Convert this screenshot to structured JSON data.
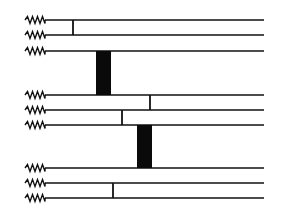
{
  "diagram": {
    "colors": {
      "line": "#111111",
      "block": "#0a0a0a",
      "background": "#ffffff"
    },
    "line_x_start": 45,
    "line_x_end": 264,
    "zigzag_x_start": 25,
    "strands": [
      {
        "id": 1,
        "y": 20
      },
      {
        "id": 2,
        "y": 35
      },
      {
        "id": 3,
        "y": 51
      },
      {
        "id": 4,
        "y": 95
      },
      {
        "id": 5,
        "y": 110
      },
      {
        "id": 6,
        "y": 125
      },
      {
        "id": 7,
        "y": 168
      },
      {
        "id": 8,
        "y": 183
      },
      {
        "id": 9,
        "y": 198
      }
    ],
    "connectors": [
      {
        "x": 73,
        "y1": 20,
        "y2": 35
      },
      {
        "x": 150,
        "y1": 95,
        "y2": 110
      },
      {
        "x": 122,
        "y1": 110,
        "y2": 125
      },
      {
        "x": 113,
        "y1": 183,
        "y2": 198
      }
    ],
    "blocks": [
      {
        "x": 96,
        "y1": 51,
        "y2": 95,
        "width": 15
      },
      {
        "x": 137,
        "y1": 125,
        "y2": 168,
        "width": 15
      }
    ]
  }
}
